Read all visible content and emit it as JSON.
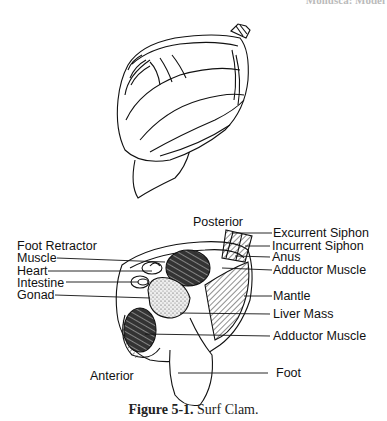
{
  "header_fragment": "Mollusca: Model",
  "figure": {
    "number": "Figure 5-1.",
    "title": "Surf Clam."
  },
  "orientation": {
    "posterior": "Posterior",
    "anterior": "Anterior"
  },
  "labels_left": [
    {
      "id": "foot-retractor-muscle",
      "line1": "Foot Retractor",
      "line2": "Muscle"
    },
    {
      "id": "heart",
      "line1": "Heart"
    },
    {
      "id": "intestine",
      "line1": "Intestine"
    },
    {
      "id": "gonad",
      "line1": "Gonad"
    }
  ],
  "labels_right": [
    {
      "id": "excurrent-siphon",
      "text": "Excurrent Siphon"
    },
    {
      "id": "incurrent-siphon",
      "text": "Incurrent Siphon"
    },
    {
      "id": "anus",
      "text": "Anus"
    },
    {
      "id": "posterior-adductor-muscle",
      "text": "Adductor Muscle"
    },
    {
      "id": "mantle",
      "text": "Mantle"
    },
    {
      "id": "liver-mass",
      "text": "Liver Mass"
    },
    {
      "id": "anterior-adductor-muscle",
      "text": "Adductor Muscle"
    },
    {
      "id": "foot",
      "text": "Foot"
    }
  ]
}
